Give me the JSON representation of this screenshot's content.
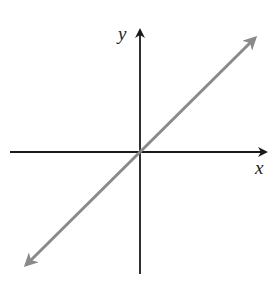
{
  "diagram": {
    "type": "coordinate-axes-with-line",
    "axes": {
      "x_label": "x",
      "y_label": "y",
      "axis_color": "#1a1a1a"
    },
    "line": {
      "description": "straight line through origin with positive slope, arrows at both ends",
      "color": "#8a8a8a"
    }
  }
}
